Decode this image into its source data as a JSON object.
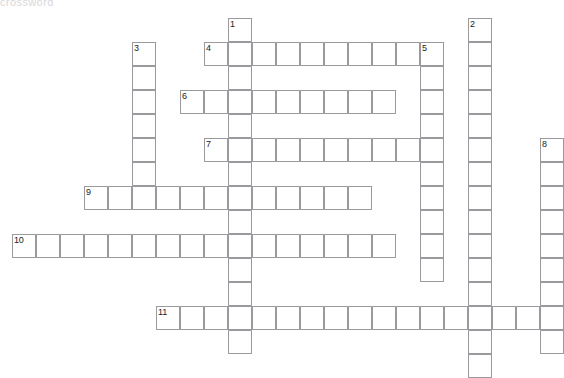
{
  "page": {
    "masthead_text": "crossword",
    "background_color": "#ffffff",
    "grid_line_color": "#9a9a9e",
    "cell_fill_color": "#ffffff",
    "number_color": "#222226",
    "cell_size_px": 24,
    "grid_origin": {
      "x": 12,
      "y": 18
    },
    "canvas": {
      "width": 564,
      "height": 371
    }
  },
  "crossword": {
    "type": "blank-grid",
    "total_entries": 11,
    "across_count": 6,
    "down_count": 5,
    "entries": [
      {
        "number": "1",
        "direction": "down",
        "col": 9,
        "row": 0,
        "length": 14,
        "label": "1"
      },
      {
        "number": "2",
        "direction": "down",
        "col": 19,
        "row": 0,
        "length": 15,
        "label": "2"
      },
      {
        "number": "3",
        "direction": "down",
        "col": 5,
        "row": 1,
        "length": 7,
        "label": "3"
      },
      {
        "number": "4",
        "direction": "across",
        "col": 8,
        "row": 1,
        "length": 10,
        "label": "4"
      },
      {
        "number": "5",
        "direction": "down",
        "col": 17,
        "row": 1,
        "length": 10,
        "label": "5"
      },
      {
        "number": "6",
        "direction": "across",
        "col": 7,
        "row": 3,
        "length": 9,
        "label": "6"
      },
      {
        "number": "7",
        "direction": "across",
        "col": 8,
        "row": 5,
        "length": 9,
        "label": "7"
      },
      {
        "number": "8",
        "direction": "down",
        "col": 22,
        "row": 5,
        "length": 9,
        "label": "8"
      },
      {
        "number": "9",
        "direction": "across",
        "col": 3,
        "row": 7,
        "length": 12,
        "label": "9"
      },
      {
        "number": "10",
        "direction": "across",
        "col": 0,
        "row": 9,
        "length": 16,
        "label": "10"
      },
      {
        "number": "11",
        "direction": "across",
        "col": 6,
        "row": 12,
        "length": 17,
        "label": "11"
      }
    ]
  }
}
